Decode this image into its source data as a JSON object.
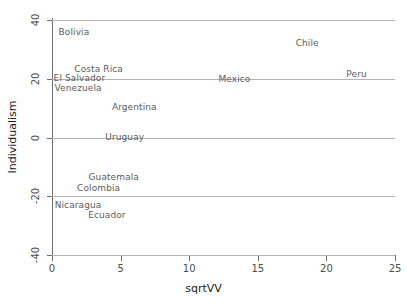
{
  "chart_data": {
    "type": "scatter",
    "title": "",
    "xlabel": "sqrtVV",
    "ylabel": "Individualism",
    "xlim": [
      0,
      25
    ],
    "ylim": [
      -40,
      40
    ],
    "xticks": [
      0,
      5,
      10,
      15,
      20,
      25
    ],
    "yticks": [
      40,
      20,
      0,
      -20,
      -40
    ],
    "xtick_labels": [
      "0",
      "5",
      "10",
      "15",
      "20",
      "25"
    ],
    "ytick_labels": [
      "40",
      "20",
      "0",
      "-20",
      "-40"
    ],
    "grid": true,
    "grid_axis": "y",
    "legend": null,
    "marker_style": "text-label",
    "points": [
      {
        "label": "Bolivia",
        "x": 1.6,
        "y": 36.0
      },
      {
        "label": "Costa Rica",
        "x": 3.4,
        "y": 23.2
      },
      {
        "label": "El Salvador",
        "x": 2.0,
        "y": 20.2
      },
      {
        "label": "Venezuela",
        "x": 1.9,
        "y": 17.0
      },
      {
        "label": "Argentina",
        "x": 6.0,
        "y": 10.5
      },
      {
        "label": "Uruguay",
        "x": 5.3,
        "y": 0.2
      },
      {
        "label": "Guatemala",
        "x": 4.5,
        "y": -13.4
      },
      {
        "label": "Colombia",
        "x": 3.4,
        "y": -17.3
      },
      {
        "label": "Nicaragua",
        "x": 1.9,
        "y": -23.0
      },
      {
        "label": "Ecuador",
        "x": 4.0,
        "y": -26.4
      },
      {
        "label": "Mexico",
        "x": 13.3,
        "y": 20.0
      },
      {
        "label": "Chile",
        "x": 18.6,
        "y": 32.2
      },
      {
        "label": "Peru",
        "x": 22.2,
        "y": 21.5
      }
    ]
  },
  "colors": {
    "background": "#ffffff",
    "gridline": "#b4b4b4",
    "axis": "#6e6e6e",
    "tick_text": "#4d4d4d",
    "axis_title": "#1a1a1a",
    "point_label": "#5c5c5c"
  }
}
